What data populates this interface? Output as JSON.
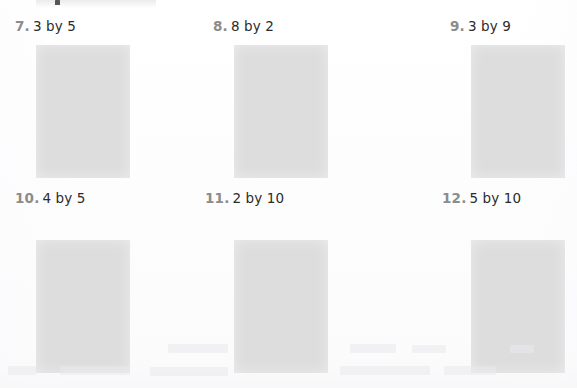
{
  "page": {
    "background_color": "#ffffff",
    "box_fill_color": "#dddddd",
    "number_color": "#8c8c8c",
    "text_color": "#2b2b2b"
  },
  "exercises": [
    {
      "number": "7.",
      "text": "3 by 5",
      "answer_box": ""
    },
    {
      "number": "8.",
      "text": "8 by 2",
      "answer_box": ""
    },
    {
      "number": "9.",
      "text": "3 by 9",
      "answer_box": ""
    },
    {
      "number": "10.",
      "text": "4 by 5",
      "answer_box": ""
    },
    {
      "number": "11.",
      "text": "2 by 10",
      "answer_box": ""
    },
    {
      "number": "12.",
      "text": "5 by 10",
      "answer_box": ""
    }
  ]
}
